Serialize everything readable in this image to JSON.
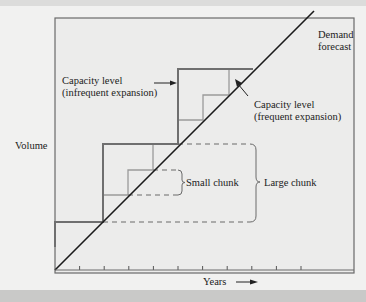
{
  "diagram": {
    "labels": {
      "demand_forecast": [
        "Demand",
        "forecast"
      ],
      "capacity_infrequent": [
        "Capacity level",
        "(infrequent expansion)"
      ],
      "capacity_frequent": [
        "Capacity level",
        "(frequent expansion)"
      ],
      "small_chunk": "Small chunk",
      "large_chunk": "Large chunk",
      "y_axis": "Volume",
      "x_axis": "Years"
    },
    "x_tick_count": 10,
    "colors": {
      "frame": "#6a6a6a",
      "demand_line": "#1a1a1a",
      "infrequent_step": "#7a7a7a",
      "frequent_step": "#9a9a9a",
      "chunk_dashed": "#6a6a6a",
      "background": "#f1f1f0"
    }
  }
}
